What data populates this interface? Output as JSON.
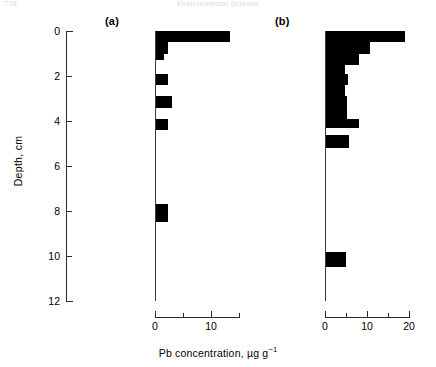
{
  "runhead": {
    "page_number": "778",
    "title": "Environmental Science"
  },
  "axes": {
    "y_title": "Depth, cm",
    "y_ticks": [
      0,
      2,
      4,
      6,
      8,
      10,
      12
    ],
    "y_min": 0,
    "y_max": 12,
    "x_title_main": "Pb concentration, ",
    "x_title_units": "µg g",
    "x_title_exp": "−1"
  },
  "panels": [
    {
      "label": "(a)",
      "x_max": 15,
      "x_ticks": [
        0,
        5,
        10,
        15
      ],
      "x_tick_labels": [
        "0",
        "",
        "10",
        ""
      ]
    },
    {
      "label": "(b)",
      "x_max": 22,
      "x_ticks": [
        0,
        5,
        10,
        15,
        20
      ],
      "x_tick_labels": [
        "0",
        "",
        "10",
        "",
        "20"
      ]
    }
  ],
  "chart_data": {
    "type": "bar",
    "orientation": "horizontal",
    "title": "",
    "xlabel": "Pb concentration, µg g⁻¹",
    "ylabel": "Depth, cm",
    "ylim": [
      0,
      12
    ],
    "y_inverted": true,
    "grid": false,
    "legend": "none",
    "panels": [
      {
        "name": "(a)",
        "xlim": [
          0,
          15
        ],
        "xticks": [
          0,
          5,
          10,
          15
        ],
        "xticklabels": [
          "0",
          "",
          "10",
          ""
        ],
        "depth_bins_cm": [
          [
            0.0,
            0.5
          ],
          [
            0.5,
            1.0
          ],
          [
            1.0,
            1.3
          ],
          [
            1.3,
            1.9
          ],
          [
            1.9,
            2.4
          ],
          [
            2.4,
            2.9
          ],
          [
            2.9,
            3.4
          ],
          [
            3.4,
            3.9
          ],
          [
            3.9,
            4.4
          ],
          [
            4.4,
            7.7
          ],
          [
            7.7,
            8.5
          ],
          [
            8.5,
            12.0
          ]
        ],
        "values": [
          13.0,
          2.2,
          1.4,
          0.0,
          2.2,
          0.0,
          2.9,
          0.0,
          2.2,
          0.0,
          2.2,
          0.0
        ]
      },
      {
        "name": "(b)",
        "xlim": [
          0,
          22
        ],
        "xticks": [
          0,
          5,
          10,
          15,
          20
        ],
        "xticklabels": [
          "0",
          "",
          "10",
          "",
          "20"
        ],
        "depth_bins_cm": [
          [
            0.0,
            0.5
          ],
          [
            0.5,
            1.0
          ],
          [
            1.0,
            1.5
          ],
          [
            1.5,
            1.9
          ],
          [
            1.9,
            2.4
          ],
          [
            2.4,
            2.9
          ],
          [
            2.9,
            3.4
          ],
          [
            3.4,
            3.9
          ],
          [
            3.9,
            4.3
          ],
          [
            4.3,
            4.6
          ],
          [
            4.6,
            5.2
          ],
          [
            5.2,
            9.8
          ],
          [
            9.8,
            10.5
          ],
          [
            10.5,
            12.0
          ]
        ],
        "values": [
          20.5,
          11.5,
          8.5,
          5.0,
          5.8,
          5.0,
          5.5,
          5.5,
          8.5,
          0.0,
          6.0,
          0.0,
          5.2,
          0.0
        ]
      }
    ]
  }
}
